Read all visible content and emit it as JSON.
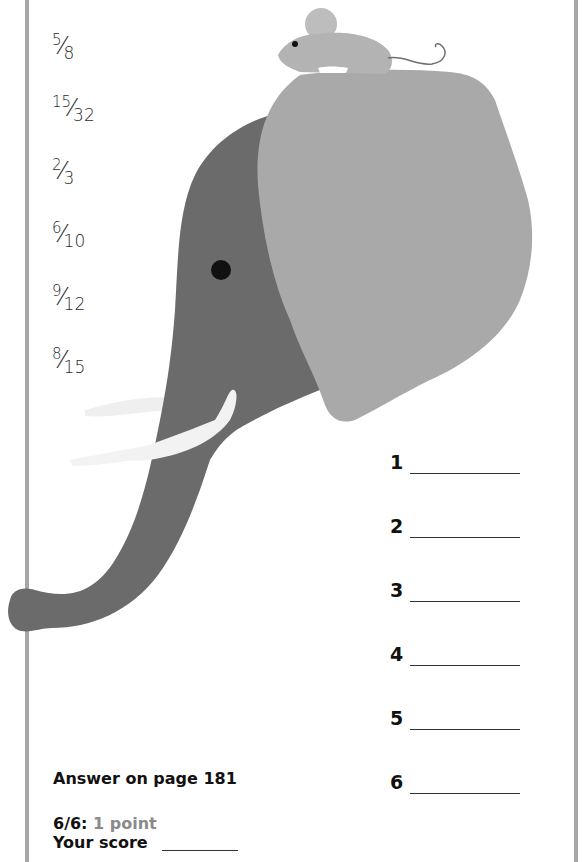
{
  "fractions": [
    {
      "numerator": "5",
      "denominator": "8"
    },
    {
      "numerator": "15",
      "denominator": "32"
    },
    {
      "numerator": "2",
      "denominator": "3"
    },
    {
      "numerator": "6",
      "denominator": "10"
    },
    {
      "numerator": "9",
      "denominator": "12"
    },
    {
      "numerator": "8",
      "denominator": "15"
    }
  ],
  "fraction_slash": "⁄",
  "answers": [
    {
      "label": "1",
      "value": ""
    },
    {
      "label": "2",
      "value": ""
    },
    {
      "label": "3",
      "value": ""
    },
    {
      "label": "4",
      "value": ""
    },
    {
      "label": "5",
      "value": ""
    },
    {
      "label": "6",
      "value": ""
    }
  ],
  "footer": {
    "answer_ref": "Answer on page 181",
    "score_rule_label": "6/6:",
    "score_rule_points": "1 point",
    "your_score_label": "Your score"
  },
  "illustration": {
    "subject": "elephant with mouse on head",
    "colors": {
      "elephant_body": "#6b6b6b",
      "elephant_ear": "#a9a9a9",
      "tusk": "#f2f2f2",
      "mouse": "#b3b3b3",
      "eye": "#111111",
      "border": "#a6a6a6"
    }
  }
}
